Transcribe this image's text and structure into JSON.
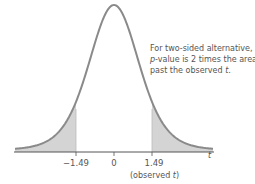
{
  "chart_data": {
    "type": "area",
    "title": "",
    "distribution": "t density curve",
    "xlabel": "t",
    "ylabel": "",
    "x_ticks": [
      "-1.49",
      "0",
      "1.49"
    ],
    "x_tick_values": [
      -1.49,
      0,
      1.49
    ],
    "observed_t": 1.49,
    "shaded_regions": [
      {
        "from": "-inf",
        "to": -1.49,
        "label": "left tail"
      },
      {
        "from": 1.49,
        "to": "inf",
        "label": "right tail"
      }
    ],
    "annotation": "For two-sided alternative, p-value is 2 times the area past the observed t.",
    "grid": false,
    "legend": null
  },
  "labels": {
    "axis_t": "t",
    "tick_neg": "−1.49",
    "tick_zero": "0",
    "tick_pos": "1.49",
    "observed_open": "(observed ",
    "observed_t": "t",
    "observed_close": ")",
    "note_line1": "For two-sided alternative,",
    "note_line2_p": "p",
    "note_line2_rest": "-value is 2 times the area",
    "note_line3_rest": "past the observed ",
    "note_line3_t": "t",
    "note_line3_end": "."
  },
  "colors": {
    "curve": "#8a8a8a",
    "shade": "#d4d4d4",
    "axis": "#555555"
  }
}
